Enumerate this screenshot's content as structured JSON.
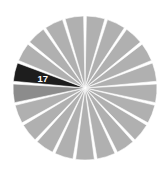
{
  "chart_data": {
    "type": "pie",
    "title": "",
    "subtitle": "",
    "xlabel": "",
    "ylabel": "",
    "grid": false,
    "legend": "none",
    "center": {
      "cx": 85,
      "cy": 88
    },
    "radius": 72,
    "start_angle_deg": -90,
    "slice_gap_deg": 2.2,
    "total_slices": 21,
    "categories": [
      "1",
      "2",
      "3",
      "4",
      "5",
      "6",
      "7",
      "8",
      "9",
      "10",
      "11",
      "12",
      "13",
      "14",
      "15",
      "16",
      "17",
      "18",
      "19",
      "20",
      "21"
    ],
    "values": [
      1,
      1,
      1,
      1,
      1,
      1,
      1,
      1,
      1,
      1,
      1,
      1,
      1,
      1,
      1,
      1,
      1,
      1,
      1,
      1,
      1
    ],
    "slices": [
      {
        "index": 0,
        "label": "",
        "value": 1,
        "color": "#b0b0b0",
        "highlighted": false,
        "label_visible": false
      },
      {
        "index": 1,
        "label": "",
        "value": 1,
        "color": "#b0b0b0",
        "highlighted": false,
        "label_visible": false
      },
      {
        "index": 2,
        "label": "",
        "value": 1,
        "color": "#b0b0b0",
        "highlighted": false,
        "label_visible": false
      },
      {
        "index": 3,
        "label": "",
        "value": 1,
        "color": "#b0b0b0",
        "highlighted": false,
        "label_visible": false
      },
      {
        "index": 4,
        "label": "",
        "value": 1,
        "color": "#b0b0b0",
        "highlighted": false,
        "label_visible": false
      },
      {
        "index": 5,
        "label": "",
        "value": 1,
        "color": "#b0b0b0",
        "highlighted": false,
        "label_visible": false
      },
      {
        "index": 6,
        "label": "",
        "value": 1,
        "color": "#b0b0b0",
        "highlighted": false,
        "label_visible": false
      },
      {
        "index": 7,
        "label": "",
        "value": 1,
        "color": "#b0b0b0",
        "highlighted": false,
        "label_visible": false
      },
      {
        "index": 8,
        "label": "",
        "value": 1,
        "color": "#b0b0b0",
        "highlighted": false,
        "label_visible": false
      },
      {
        "index": 9,
        "label": "",
        "value": 1,
        "color": "#b0b0b0",
        "highlighted": false,
        "label_visible": false
      },
      {
        "index": 10,
        "label": "",
        "value": 1,
        "color": "#b0b0b0",
        "highlighted": false,
        "label_visible": false
      },
      {
        "index": 11,
        "label": "",
        "value": 1,
        "color": "#b0b0b0",
        "highlighted": false,
        "label_visible": false
      },
      {
        "index": 12,
        "label": "",
        "value": 1,
        "color": "#b0b0b0",
        "highlighted": false,
        "label_visible": false
      },
      {
        "index": 13,
        "label": "",
        "value": 1,
        "color": "#b0b0b0",
        "highlighted": false,
        "label_visible": false
      },
      {
        "index": 14,
        "label": "",
        "value": 1,
        "color": "#b0b0b0",
        "highlighted": false,
        "label_visible": false
      },
      {
        "index": 15,
        "label": "",
        "value": 1,
        "color": "#8c8c8c",
        "highlighted": false,
        "label_visible": false
      },
      {
        "index": 16,
        "label": "17",
        "value": 1,
        "color": "#1d1d1d",
        "highlighted": true,
        "label_visible": true
      },
      {
        "index": 17,
        "label": "",
        "value": 1,
        "color": "#b0b0b0",
        "highlighted": false,
        "label_visible": false
      },
      {
        "index": 18,
        "label": "",
        "value": 1,
        "color": "#b0b0b0",
        "highlighted": false,
        "label_visible": false
      },
      {
        "index": 19,
        "label": "",
        "value": 1,
        "color": "#b0b0b0",
        "highlighted": false,
        "label_visible": false
      },
      {
        "index": 20,
        "label": "",
        "value": 1,
        "color": "#b0b0b0",
        "highlighted": false,
        "label_visible": false
      }
    ],
    "colors": {
      "background": "#ffffff",
      "default_slice": "#b0b0b0",
      "secondary_slice": "#8c8c8c",
      "highlight_slice": "#1d1d1d",
      "separator": "#ffffff",
      "label_text": "#ffffff"
    },
    "annotations": [
      {
        "text": "17",
        "slice_index": 16,
        "color": "#ffffff"
      }
    ]
  }
}
